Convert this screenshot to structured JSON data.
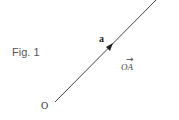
{
  "figure": {
    "caption": "Fig. 1",
    "vector_label": "a",
    "origin_label": "O",
    "vector_notation": "OA",
    "vector_arrow_symbol": "→",
    "line_color": "#444444"
  }
}
